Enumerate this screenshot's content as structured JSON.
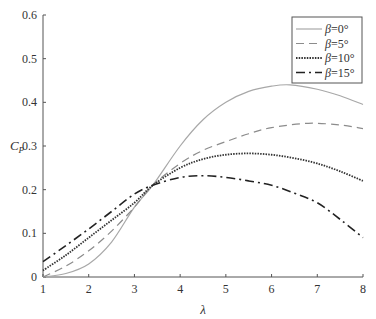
{
  "chart_data": {
    "type": "line",
    "title": "",
    "xlabel": "λ",
    "ylabel": "C_P",
    "xlim": [
      1,
      8
    ],
    "ylim": [
      0,
      0.6
    ],
    "xticks": [
      "1",
      "2",
      "3",
      "4",
      "5",
      "6",
      "7",
      "8"
    ],
    "yticks": [
      "0",
      "0.1",
      "0.2",
      "0.3",
      "0.4",
      "0.5",
      "0.6"
    ],
    "grid": false,
    "legend_position": "upper right",
    "series": [
      {
        "name": "β=0°",
        "style": "solid",
        "color": "#a8a8a8",
        "x": [
          1,
          1.5,
          2,
          2.5,
          3,
          3.4,
          4,
          4.5,
          5,
          5.5,
          6,
          6.4,
          7,
          7.5,
          8
        ],
        "y": [
          0,
          0.008,
          0.03,
          0.08,
          0.16,
          0.21,
          0.3,
          0.36,
          0.4,
          0.425,
          0.437,
          0.44,
          0.43,
          0.415,
          0.395
        ]
      },
      {
        "name": "β=5°",
        "style": "dashed",
        "color": "#8c8c8c",
        "x": [
          1,
          1.5,
          2,
          2.5,
          3,
          3.4,
          4,
          4.5,
          5,
          5.5,
          6,
          6.8,
          7.5,
          8
        ],
        "y": [
          0,
          0.025,
          0.06,
          0.105,
          0.16,
          0.21,
          0.26,
          0.29,
          0.31,
          0.328,
          0.342,
          0.352,
          0.348,
          0.34
        ]
      },
      {
        "name": "β=10°",
        "style": "dotted",
        "color": "#333333",
        "x": [
          1,
          1.5,
          2,
          2.5,
          3,
          3.4,
          4,
          4.5,
          5,
          5.5,
          6,
          6.5,
          7,
          7.5,
          8
        ],
        "y": [
          0.015,
          0.05,
          0.09,
          0.13,
          0.17,
          0.21,
          0.25,
          0.27,
          0.28,
          0.283,
          0.28,
          0.272,
          0.26,
          0.242,
          0.22
        ]
      },
      {
        "name": "β=15°",
        "style": "dashdot",
        "color": "#222222",
        "x": [
          1,
          1.5,
          2,
          2.5,
          3,
          3.4,
          4,
          4.5,
          5,
          5.5,
          6,
          6.5,
          7,
          7.5,
          8
        ],
        "y": [
          0.035,
          0.072,
          0.11,
          0.15,
          0.19,
          0.21,
          0.228,
          0.232,
          0.228,
          0.22,
          0.21,
          0.192,
          0.17,
          0.132,
          0.09
        ]
      }
    ]
  }
}
